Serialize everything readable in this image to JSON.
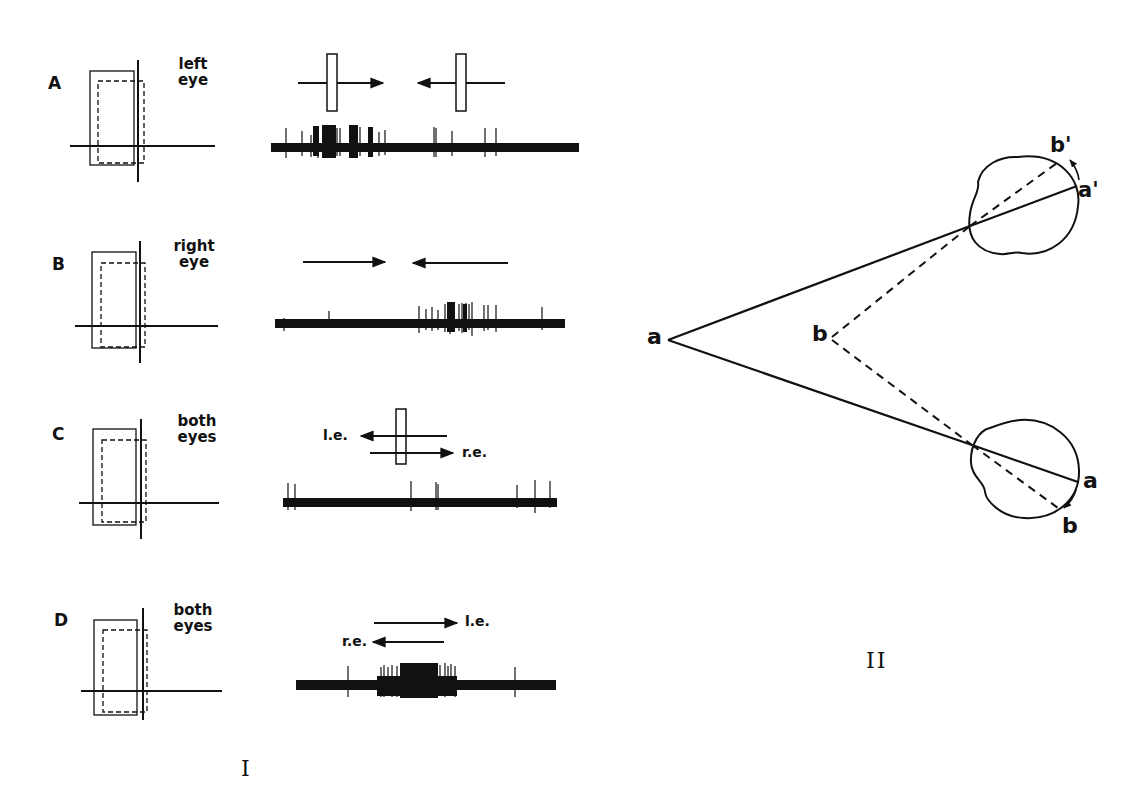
{
  "figure": {
    "part_I": {
      "label": "I",
      "rows": [
        {
          "letter": "A",
          "eye_label_line1": "left",
          "eye_label_line2": "eye",
          "stimulus": "bar moved back and forth across receptive field",
          "arrow_labels": [],
          "response": "strong burst during rightward movement, few spikes during leftward movement"
        },
        {
          "letter": "B",
          "eye_label_line1": "right",
          "eye_label_line2": "eye",
          "stimulus": "movement back and forth",
          "arrow_labels": [],
          "response": "burst during leftward movement"
        },
        {
          "letter": "C",
          "eye_label_line1": "both",
          "eye_label_line2": "eyes",
          "stimulus": "opposite directions in the two eyes",
          "arrow_labels": [
            "l.e.",
            "r.e."
          ],
          "response": "almost no response"
        },
        {
          "letter": "D",
          "eye_label_line1": "both",
          "eye_label_line2": "eyes",
          "stimulus": "opposite directions in the two eyes (reversed)",
          "arrow_labels": [
            "l.e.",
            "r.e."
          ],
          "response": "strong burst"
        }
      ]
    },
    "part_II": {
      "label": "II",
      "points": {
        "a": "a",
        "b": "b",
        "a_prime": "a'",
        "b_prime": "b'",
        "a_lower": "a",
        "b_lower": "b"
      }
    },
    "colors": {
      "ink": "#111111",
      "background": "#ffffff"
    }
  }
}
